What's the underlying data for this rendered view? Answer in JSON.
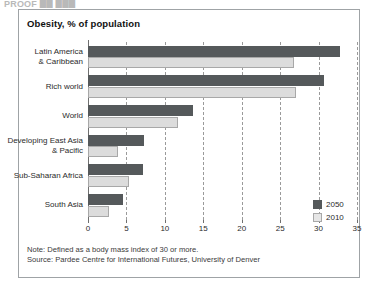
{
  "top_clip_text": "PROOF  ██ ███",
  "frame": {
    "note": "Note: Defined as a body mass index of 30 or more.",
    "source": "Source: Pardee Centre for International Futures, University of Denver"
  },
  "colors": {
    "series_2050": "#55595b",
    "series_2010": "#dcdcdc",
    "grid": "#9a9a9a",
    "frame_border": "#9fa3a6",
    "text": "#2b2b2b"
  },
  "legend": {
    "position": "bottom-right",
    "entries": [
      {
        "label": "2050",
        "color": "#55595b"
      },
      {
        "label": "2010",
        "color": "#dcdcdc"
      }
    ]
  },
  "chart_data": {
    "type": "bar",
    "orientation": "horizontal",
    "title": "Obesity, % of population",
    "subtitle": "",
    "xlabel": "",
    "ylabel": "",
    "xlim": [
      0,
      35
    ],
    "ticks": [
      0,
      5,
      10,
      15,
      20,
      25,
      30,
      35
    ],
    "tick_labels": [
      "0",
      "5",
      "10",
      "15",
      "20",
      "25",
      "30",
      "35"
    ],
    "grid": true,
    "grid_axis": "x",
    "legend_entries": [
      "2050",
      "2010"
    ],
    "categories": [
      "Latin America\n& Caribbean",
      "Rich world",
      "World",
      "Developing East Asia\n& Pacific",
      "Sub-Saharan Africa",
      "South Asia"
    ],
    "category_lines": [
      [
        "Latin America",
        "& Caribbean"
      ],
      [
        "Rich world"
      ],
      [
        "World"
      ],
      [
        "Developing East Asia",
        "& Pacific"
      ],
      [
        "Sub-Saharan Africa"
      ],
      [
        "South Asia"
      ]
    ],
    "series": [
      {
        "name": "2050",
        "color": "#55595b",
        "values": [
          32.8,
          30.7,
          13.7,
          7.3,
          7.1,
          4.6
        ]
      },
      {
        "name": "2010",
        "color": "#dcdcdc",
        "values": [
          26.8,
          27.0,
          11.7,
          3.9,
          5.3,
          2.7
        ]
      }
    ],
    "note": "Note: Defined as a body mass index of 30 or more.",
    "source": "Source: Pardee Centre for International Futures, University of Denver"
  }
}
